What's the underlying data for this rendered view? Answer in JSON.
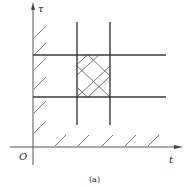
{
  "diagram": {
    "caption": "(a)",
    "axes": {
      "y_label": "τ",
      "x_label": "t",
      "origin_label": "O"
    },
    "colors": {
      "line": "#3a3a3a",
      "axis": "#555555",
      "hatch": "#666666",
      "background": "#ffffff"
    },
    "horizontal_lines": [
      {
        "y": 55,
        "x1": 33,
        "x2": 166
      },
      {
        "y": 97,
        "x1": 33,
        "x2": 166
      }
    ],
    "vertical_lines": [
      {
        "x": 77,
        "y1": 22,
        "y2": 125
      },
      {
        "x": 110,
        "y1": 22,
        "y2": 125
      }
    ],
    "cross_hatched_region": {
      "x1": 77,
      "y1": 55,
      "x2": 110,
      "y2": 97
    },
    "boundary_hatching": [
      "along tau axis (t = 0)",
      "along t axis (tau = 0)"
    ]
  }
}
